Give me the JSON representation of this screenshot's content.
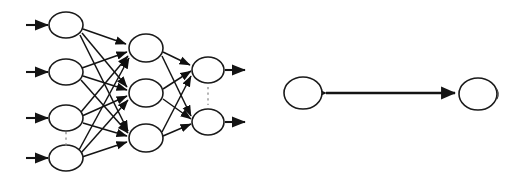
{
  "figure": {
    "background_color": "#ffffff",
    "stroke_color": "#141414",
    "node_fill_color": "#ffffff",
    "node_stroke_color": "#1a1a1a",
    "dots_color": "#8d8d8d",
    "width": 519,
    "height": 176
  },
  "left_diagram": {
    "name": "feedforward-neural-network",
    "layers": [
      {
        "name": "input-layer",
        "label": "input layer",
        "node_count": 4,
        "node_rx": 17,
        "node_ry": 13,
        "nodes": [
          {
            "id": "input-node-1",
            "cx": 66,
            "cy": 25
          },
          {
            "id": "input-node-2",
            "cx": 66,
            "cy": 72
          },
          {
            "id": "input-node-3",
            "cx": 66,
            "cy": 118
          },
          {
            "id": "input-node-4",
            "cx": 66,
            "cy": 158
          }
        ],
        "ellipsis": {
          "x": 66,
          "y1": 133,
          "y2": 145
        }
      },
      {
        "name": "hidden-layer",
        "label": "hidden layer",
        "node_count": 3,
        "node_rx": 17,
        "node_ry": 14,
        "nodes": [
          {
            "id": "hidden-node-1",
            "cx": 146,
            "cy": 48
          },
          {
            "id": "hidden-node-2",
            "cx": 146,
            "cy": 93
          },
          {
            "id": "hidden-node-3",
            "cx": 146,
            "cy": 138
          }
        ]
      },
      {
        "name": "output-layer",
        "label": "output layer",
        "node_count": 2,
        "node_rx": 16,
        "node_ry": 13,
        "nodes": [
          {
            "id": "output-node-1",
            "cx": 208,
            "cy": 70
          },
          {
            "id": "output-node-2",
            "cx": 208,
            "cy": 122
          }
        ],
        "ellipsis": {
          "x": 208,
          "y1": 88,
          "y2": 104
        }
      }
    ],
    "input_arrows": [
      {
        "id": "input-arrow-1",
        "x1": 26,
        "y1": 25,
        "x2": 48,
        "y2": 25
      },
      {
        "id": "input-arrow-2",
        "x1": 26,
        "y1": 72,
        "x2": 48,
        "y2": 72
      },
      {
        "id": "input-arrow-3",
        "x1": 26,
        "y1": 118,
        "x2": 48,
        "y2": 118
      },
      {
        "id": "input-arrow-4",
        "x1": 26,
        "y1": 158,
        "x2": 48,
        "y2": 158
      }
    ],
    "output_arrows": [
      {
        "id": "output-arrow-1",
        "x1": 225,
        "y1": 70,
        "x2": 247,
        "y2": 70
      },
      {
        "id": "output-arrow-2",
        "x1": 225,
        "y1": 122,
        "x2": 247,
        "y2": 122
      }
    ],
    "connections": {
      "input_to_hidden": "fully-connected",
      "hidden_to_output": "fully-connected",
      "input_to_hidden_count": 12,
      "hidden_to_output_count": 6,
      "direction": "left-to-right"
    }
  },
  "right_diagram": {
    "name": "bidirectional-node-pair",
    "nodes": [
      {
        "id": "pair-node-left",
        "cx": 303,
        "cy": 93,
        "rx": 19,
        "ry": 16
      },
      {
        "id": "pair-node-right",
        "cx": 478,
        "cy": 94,
        "rx": 19,
        "ry": 16
      }
    ],
    "link": {
      "id": "bidirectional-link",
      "x1": 322,
      "x2": 459,
      "y": 93,
      "arrowheads": "both"
    }
  }
}
